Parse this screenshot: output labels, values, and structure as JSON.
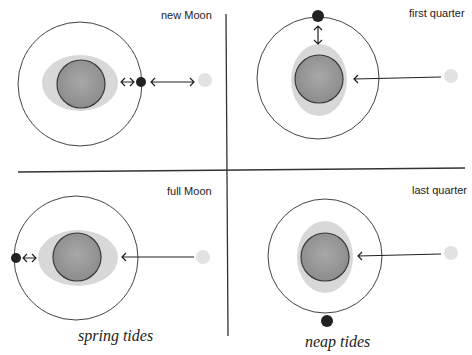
{
  "colors": {
    "background": "#ffffff",
    "line": "#333333",
    "earth_fill": "#9a9a9a",
    "earth_stroke": "#3a3a3a",
    "tidal_bulge": "#d8d8d8",
    "moon": "#2a2a2a",
    "sun": "#e2e2e2"
  },
  "panels": [
    {
      "id": "new-moon",
      "label": "new Moon",
      "group": "spring"
    },
    {
      "id": "first-quarter",
      "label": "first quarter",
      "group": "neap"
    },
    {
      "id": "full-moon",
      "label": "full Moon",
      "group": "spring"
    },
    {
      "id": "last-quarter",
      "label": "last quarter",
      "group": "neap"
    }
  ],
  "captions": {
    "spring": "spring tides",
    "neap": "neap tides"
  }
}
